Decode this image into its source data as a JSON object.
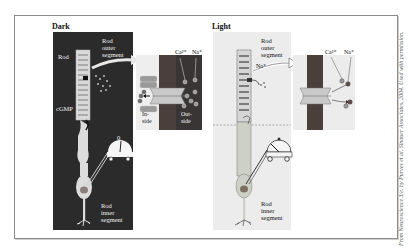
{
  "figure": {
    "credit": "From Neuroscience 3/e, by Purves et al. Sinauer Associates, 2004. Used with permission.",
    "colors": {
      "dark_panel": "#2b2b2b",
      "light_panel": "#ececec",
      "membrane": "#4a3f3a",
      "channel": "#c9c9c9",
      "ion_dark_fill": "#8c8c8c",
      "frame_border": "#8a8a8a"
    },
    "dark": {
      "title": "Dark",
      "labels": {
        "rod": "Rod",
        "rod_outer_segment": [
          "Rod",
          "outer",
          "segment"
        ],
        "cgmp": "cGMP",
        "rod_inner_segment": [
          "Rod",
          "inner",
          "segment"
        ],
        "meter_value": "0",
        "inside": [
          "In-",
          "side"
        ],
        "outside": [
          "Out-",
          "side"
        ],
        "ca": "Ca²⁺",
        "na": "Na⁺",
        "cgmp_tag": "cGMP"
      }
    },
    "light": {
      "title": "Light",
      "labels": {
        "rod_outer_segment": [
          "Rod",
          "outer",
          "segment"
        ],
        "na": "Na⁺",
        "rod_inner_segment": [
          "Rod",
          "inner",
          "segment"
        ],
        "ca": "Ca²⁺",
        "na_inset": "Na⁺"
      }
    }
  }
}
